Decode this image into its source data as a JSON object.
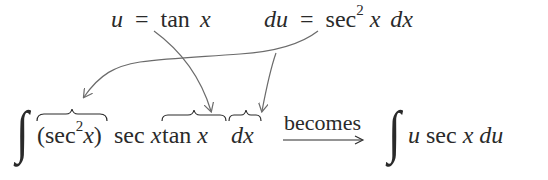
{
  "top": {
    "u_def": {
      "lhs": "u",
      "eq": "=",
      "rhs_fn": "tan",
      "rhs_var": "x"
    },
    "du_def": {
      "lhs": "du",
      "eq": "=",
      "rhs_fn": "sec",
      "rhs_exp": "2",
      "rhs_var": "x",
      "rhs_diff": "dx"
    }
  },
  "bottom": {
    "integral_symbol": "∫",
    "term1": {
      "open": "(",
      "fn": "sec",
      "exp": "2",
      "var": "x",
      "close": ")"
    },
    "term2": {
      "fn": "sec",
      "var": "x"
    },
    "term3": {
      "fn": "tan",
      "var": "x"
    },
    "term4": {
      "diff": "dx"
    },
    "arrow_label": "becomes",
    "result": {
      "integral_symbol": "∫",
      "u": "u",
      "fn": "sec",
      "var": "x",
      "du": "du"
    }
  },
  "colors": {
    "text": "#2a2a2a",
    "arrows": "#6b6b6b"
  }
}
